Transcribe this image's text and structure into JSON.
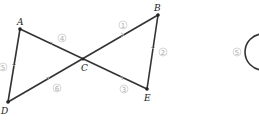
{
  "diagram": {
    "points": {
      "A": {
        "label": "A",
        "x": 20,
        "y": 29
      },
      "B": {
        "label": "B",
        "x": 158,
        "y": 15
      },
      "C": {
        "label": "C",
        "x": 83,
        "y": 59
      },
      "D": {
        "label": "D",
        "x": 8,
        "y": 102
      },
      "E": {
        "label": "E",
        "x": 147,
        "y": 89
      }
    },
    "segments": [
      {
        "from": "A",
        "to": "E",
        "name": "AE"
      },
      {
        "from": "D",
        "to": "B",
        "name": "DB"
      },
      {
        "from": "A",
        "to": "D",
        "name": "AD"
      },
      {
        "from": "B",
        "to": "E",
        "name": "BE"
      }
    ],
    "markers": [
      {
        "label": "1",
        "segment": "CB"
      },
      {
        "label": "2",
        "segment": "BE"
      },
      {
        "label": "3",
        "segment": "CE"
      },
      {
        "label": "4",
        "segment": "AC"
      },
      {
        "label": "5",
        "segment": "AD"
      },
      {
        "label": "6",
        "segment": "DC"
      }
    ],
    "partial_figure": {
      "shape": "circle",
      "marker_label": "5"
    }
  }
}
